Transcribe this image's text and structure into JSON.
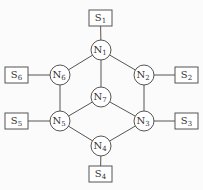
{
  "diagram": {
    "nodes": [
      {
        "id": "N1",
        "label": "N",
        "sub": "1",
        "x": 101,
        "y": 50
      },
      {
        "id": "N2",
        "label": "N",
        "sub": "2",
        "x": 144,
        "y": 75
      },
      {
        "id": "N3",
        "label": "N",
        "sub": "3",
        "x": 144,
        "y": 121
      },
      {
        "id": "N4",
        "label": "N",
        "sub": "4",
        "x": 101,
        "y": 146
      },
      {
        "id": "N5",
        "label": "N",
        "sub": "5",
        "x": 60,
        "y": 121
      },
      {
        "id": "N6",
        "label": "N",
        "sub": "6",
        "x": 60,
        "y": 75
      },
      {
        "id": "N7",
        "label": "N",
        "sub": "7",
        "x": 101,
        "y": 97
      }
    ],
    "stations": [
      {
        "id": "S1",
        "label": "S",
        "sub": "1",
        "x": 89,
        "y": 10,
        "attach": "N1"
      },
      {
        "id": "S2",
        "label": "S",
        "sub": "2",
        "x": 175,
        "y": 67,
        "attach": "N2"
      },
      {
        "id": "S3",
        "label": "S",
        "sub": "3",
        "x": 175,
        "y": 113,
        "attach": "N3"
      },
      {
        "id": "S4",
        "label": "S",
        "sub": "4",
        "x": 89,
        "y": 166,
        "attach": "N4"
      },
      {
        "id": "S5",
        "label": "S",
        "sub": "5",
        "x": 5,
        "y": 113,
        "attach": "N5"
      },
      {
        "id": "S6",
        "label": "S",
        "sub": "6",
        "x": 5,
        "y": 67,
        "attach": "N6"
      }
    ],
    "edges": [
      [
        "N1",
        "N2"
      ],
      [
        "N1",
        "N6"
      ],
      [
        "N1",
        "N7"
      ],
      [
        "N2",
        "N3"
      ],
      [
        "N6",
        "N5"
      ],
      [
        "N7",
        "N5"
      ],
      [
        "N7",
        "N3"
      ],
      [
        "N5",
        "N4"
      ],
      [
        "N3",
        "N4"
      ]
    ],
    "colors": {
      "stroke": "#555555",
      "fill": "#ffffff",
      "text": "#333333"
    }
  }
}
